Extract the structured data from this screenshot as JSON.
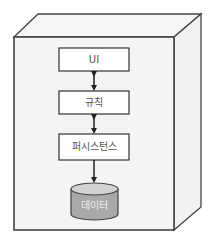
{
  "diagram": {
    "type": "layered-architecture",
    "container": {
      "shape": "3d-box",
      "front_fill": "#f4f4f4",
      "side_fill": "#f2f2f2",
      "stroke": "#444444"
    },
    "layers": [
      {
        "id": "ui",
        "label": "UI"
      },
      {
        "id": "rules",
        "label": "규칙"
      },
      {
        "id": "persistence",
        "label": "퍼시스턴스"
      }
    ],
    "storage": {
      "label": "데이터",
      "shape": "cylinder",
      "fill": "#a9a9a9",
      "top_fill": "#d2d2d2"
    },
    "connections": [
      {
        "from": "ui",
        "to": "rules",
        "direction": "bidirectional"
      },
      {
        "from": "rules",
        "to": "persistence",
        "direction": "bidirectional"
      },
      {
        "from": "persistence",
        "to": "storage",
        "direction": "forward"
      }
    ]
  }
}
